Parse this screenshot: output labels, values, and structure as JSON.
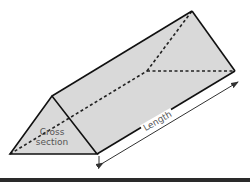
{
  "diagram": {
    "type": "triangular prism",
    "labels": {
      "cross_section_line1": "Cross",
      "cross_section_line2": "section",
      "length": "Length"
    },
    "colors": {
      "face_fill": "#d9d9d9",
      "edge": "#111111",
      "hidden_edge": "#222222",
      "label_text": "#555555",
      "bottom_bar": "#2a2a2a"
    }
  }
}
